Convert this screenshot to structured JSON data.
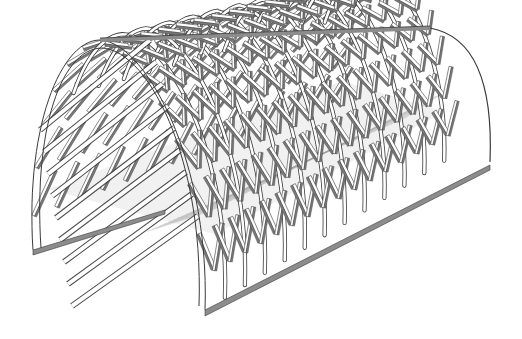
{
  "scene": {
    "subject": "lattice barrel-vault tunnel structure",
    "background_color": "#ffffff",
    "colors": {
      "member_face": "#ffffff",
      "member_shadow": "#7a7a7a",
      "edge_line": "#3a3a3a",
      "floor_hatch": "#9a9a9a",
      "rail": "#8c8c8c"
    },
    "front_arch": {
      "left_foot": [
        33,
        250
      ],
      "crown": [
        100,
        40
      ],
      "right_foot": [
        205,
        310
      ]
    },
    "ridge": {
      "start": [
        100,
        40
      ],
      "end": [
        430,
        28
      ]
    },
    "back_end": {
      "top": [
        460,
        35
      ],
      "bottom": [
        490,
        162
      ]
    },
    "base_rail_right": {
      "start": [
        205,
        310
      ],
      "end": [
        490,
        165
      ]
    },
    "base_rail_left": {
      "start": [
        33,
        250
      ],
      "end": [
        165,
        210
      ]
    },
    "rib_count": 12
  }
}
